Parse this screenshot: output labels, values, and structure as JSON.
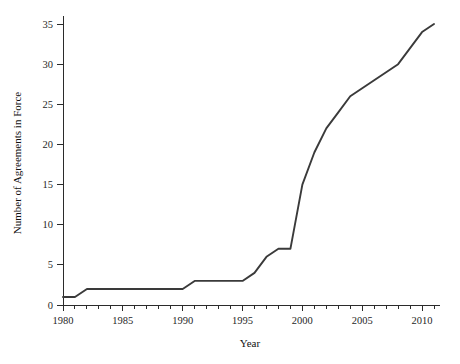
{
  "chart_data": {
    "type": "line",
    "title": "",
    "xlabel": "Year",
    "ylabel": "Number of Agreements in Force",
    "xlim": [
      1980,
      2011.5
    ],
    "ylim": [
      0,
      36
    ],
    "grid": false,
    "legend": null,
    "x_ticks_major": [
      1980,
      1985,
      1990,
      1995,
      2000,
      2005,
      2010
    ],
    "x_tick_labels": [
      "1980",
      "1985",
      "1990",
      "1995",
      "2000",
      "2005",
      "2010"
    ],
    "x_ticks_minor_step": 1,
    "y_ticks_major": [
      0,
      5,
      10,
      15,
      20,
      25,
      30,
      35
    ],
    "y_tick_labels": [
      "0",
      "5",
      "10",
      "15",
      "20",
      "25",
      "30",
      "35"
    ],
    "series": [
      {
        "name": "Agreements in Force",
        "color": "#3a3a3a",
        "x": [
          1980,
          1981,
          1982,
          1983,
          1984,
          1985,
          1986,
          1987,
          1988,
          1989,
          1990,
          1991,
          1992,
          1993,
          1994,
          1995,
          1996,
          1997,
          1998,
          1999,
          2000,
          2001,
          2002,
          2003,
          2004,
          2005,
          2006,
          2007,
          2008,
          2009,
          2010,
          2011
        ],
        "y": [
          1,
          1,
          2,
          2,
          2,
          2,
          2,
          2,
          2,
          2,
          2,
          3,
          3,
          3,
          3,
          3,
          4,
          6,
          7,
          7,
          15,
          19,
          22,
          24,
          26,
          27,
          28,
          29,
          30,
          32,
          34,
          35
        ]
      }
    ]
  },
  "axis_titles": {
    "x": "Year",
    "y": "Number of Agreements in Force"
  }
}
